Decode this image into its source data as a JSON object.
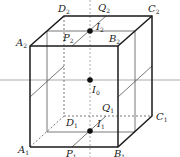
{
  "figure": {
    "labels": {
      "A2": {
        "letter": "A",
        "sub": "2"
      },
      "B2": {
        "letter": "B",
        "sub": "2"
      },
      "C2": {
        "letter": "C",
        "sub": "2"
      },
      "D2": {
        "letter": "D",
        "sub": "2"
      },
      "P2": {
        "letter": "P",
        "sub": "2"
      },
      "Q2": {
        "letter": "Q",
        "sub": "2"
      },
      "I2": {
        "letter": "I",
        "sub": "2"
      },
      "I0": {
        "letter": "I",
        "sub": "0"
      },
      "A1": {
        "letter": "A",
        "sub": "1"
      },
      "B1": {
        "letter": "B",
        "sub": "1"
      },
      "C1": {
        "letter": "C",
        "sub": "1"
      },
      "D1": {
        "letter": "D",
        "sub": "1"
      },
      "P1": {
        "letter": "P",
        "sub": "1"
      },
      "Q1": {
        "letter": "Q",
        "sub": "1"
      },
      "I1": {
        "letter": "I",
        "sub": "1"
      }
    }
  }
}
